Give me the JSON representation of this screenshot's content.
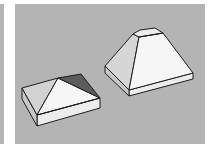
{
  "scene": {
    "description": "3D model viewport showing two hipped-roof shapes on a gray background",
    "background_color": "#b4b4b4",
    "objects": [
      {
        "name": "flat-pyramid-cap",
        "label": "Pyramid cap (low)"
      },
      {
        "name": "truncated-pyramid-cap",
        "label": "Truncated pyramid cap (tall)"
      }
    ]
  },
  "colors": {
    "face_light": "#f4f4f4",
    "face_mid": "#d6d6d6",
    "face_side": "#e6e6e6",
    "face_dark": "#5c5c5c",
    "edge": "#1e1e1e"
  }
}
